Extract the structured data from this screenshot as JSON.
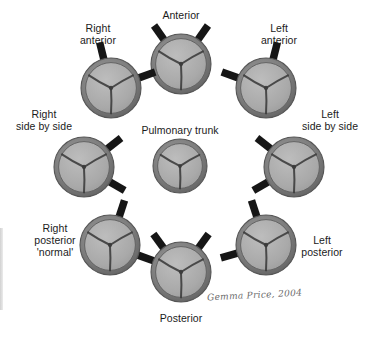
{
  "figure": {
    "signature": "Gemma Price, 2004",
    "colors": {
      "background": "#ffffff",
      "ring_outer": "#6e6e6e",
      "ring_inner": "#8e8e8e",
      "leaflet": "#a8a8a8",
      "leaflet_highlight": "#b8b8b8",
      "commissure": "#3a3a3a",
      "artery_tab": "#161616",
      "label_text": "#1b1b1b"
    }
  },
  "center": {
    "name": "pulmonary-trunk",
    "label": "Pulmonary trunk",
    "cx": 180,
    "cy": 166,
    "r": 27,
    "label_x": 180,
    "label_y": 124,
    "arteries": []
  },
  "positions": [
    {
      "name": "anterior",
      "label": "Anterior",
      "cx": 181,
      "cy": 64,
      "r": 30,
      "label_x": 181,
      "label_y": 9,
      "rotation": 0,
      "arteries": [
        {
          "name": "right-coronary-ostium",
          "angle": 125,
          "length": 17
        },
        {
          "name": "left-coronary-ostium",
          "angle": 55,
          "length": 17
        }
      ]
    },
    {
      "name": "right-anterior",
      "label": "Right\nanterior",
      "cx": 111,
      "cy": 88,
      "r": 30,
      "label_x": 98,
      "label_y": 22,
      "rotation": 0,
      "arteries": [
        {
          "name": "right-coronary-ostium",
          "angle": 20,
          "length": 17
        },
        {
          "name": "left-coronary-ostium",
          "angle": 104,
          "length": 17
        }
      ]
    },
    {
      "name": "left-anterior",
      "label": "Left\nanterior",
      "cx": 266,
      "cy": 88,
      "r": 30,
      "label_x": 279,
      "label_y": 22,
      "rotation": 0,
      "arteries": [
        {
          "name": "right-coronary-ostium",
          "angle": 160,
          "length": 17
        },
        {
          "name": "left-coronary-ostium",
          "angle": 76,
          "length": 17
        }
      ]
    },
    {
      "name": "right-side-by-side",
      "label": "Right\nside by side",
      "cx": 84,
      "cy": 167,
      "r": 30,
      "label_x": 44,
      "label_y": 108,
      "rotation": 0,
      "arteries": [
        {
          "name": "right-coronary-ostium",
          "angle": 38,
          "length": 17
        },
        {
          "name": "left-coronary-ostium",
          "angle": 330,
          "length": 17
        }
      ]
    },
    {
      "name": "left-side-by-side",
      "label": "Left\nside by side",
      "cx": 294,
      "cy": 167,
      "r": 30,
      "label_x": 330,
      "label_y": 108,
      "rotation": 0,
      "arteries": [
        {
          "name": "right-coronary-ostium",
          "angle": 142,
          "length": 17
        },
        {
          "name": "left-coronary-ostium",
          "angle": 210,
          "length": 17
        }
      ]
    },
    {
      "name": "right-posterior-normal",
      "label": "Right\nposterior\n'normal'",
      "cx": 110,
      "cy": 245,
      "r": 30,
      "label_x": 55,
      "label_y": 222,
      "rotation": 0,
      "arteries": [
        {
          "name": "right-coronary-ostium",
          "angle": 72,
          "length": 17
        },
        {
          "name": "left-coronary-ostium",
          "angle": 340,
          "length": 17
        }
      ]
    },
    {
      "name": "left-posterior",
      "label": "Left\nposterior",
      "cx": 266,
      "cy": 245,
      "r": 30,
      "label_x": 322,
      "label_y": 234,
      "rotation": 0,
      "arteries": [
        {
          "name": "right-coronary-ostium",
          "angle": 108,
          "length": 17
        },
        {
          "name": "left-coronary-ostium",
          "angle": 196,
          "length": 17
        }
      ]
    },
    {
      "name": "posterior",
      "label": "Posterior",
      "cx": 181,
      "cy": 272,
      "r": 30,
      "label_x": 181,
      "label_y": 312,
      "rotation": 0,
      "arteries": [
        {
          "name": "right-coronary-ostium",
          "angle": 126,
          "length": 17
        },
        {
          "name": "left-coronary-ostium",
          "angle": 54,
          "length": 17
        }
      ]
    }
  ],
  "signature_position": {
    "x": 207,
    "y": 290
  }
}
